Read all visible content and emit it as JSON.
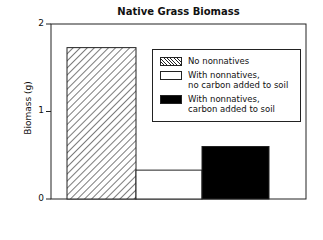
{
  "chart_data": {
    "type": "bar",
    "title": "Native Grass Biomass",
    "xlabel": "",
    "ylabel": "Biomass (g)",
    "ylim": [
      0,
      2
    ],
    "yticks": [
      "0",
      "1",
      "2"
    ],
    "grid": false,
    "legend_position": "upper right, inside plot",
    "categories": [
      "No nonnatives",
      "With nonnatives, no carbon added to soil",
      "With nonnatives, carbon added to soil"
    ],
    "values": [
      1.73,
      0.33,
      0.6
    ],
    "fills": [
      "hatched",
      "white",
      "black"
    ]
  },
  "legend": {
    "items": [
      {
        "line1": "No nonnatives",
        "line2": ""
      },
      {
        "line1": "With nonnatives,",
        "line2": "no carbon added to soil"
      },
      {
        "line1": "With nonnatives,",
        "line2": "carbon added to soil"
      }
    ]
  }
}
